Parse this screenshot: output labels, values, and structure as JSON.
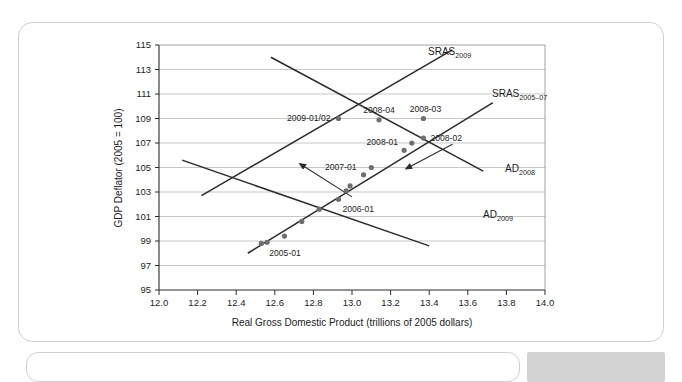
{
  "figure": {
    "background_color": "#ffffff",
    "border_color": "#cfcfcf"
  },
  "chart_data": {
    "type": "scatter",
    "title": "",
    "subtitle": "",
    "xlabel": "Real Gross Domestic Product (trillions of 2005 dollars)",
    "ylabel": "GDP Deflator (2005 = 100)",
    "xlim": [
      12.0,
      14.0
    ],
    "ylim": [
      95,
      115
    ],
    "xticks": [
      "12.0",
      "12.2",
      "12.4",
      "12.6",
      "12.8",
      "13.0",
      "13.2",
      "13.4",
      "13.6",
      "13.8",
      "14.0"
    ],
    "yticks": [
      "95",
      "97",
      "99",
      "101",
      "103",
      "105",
      "107",
      "109",
      "111",
      "113",
      "115"
    ],
    "grid": "horizontal",
    "legend": "none",
    "point_color": "#6e6e6e",
    "line_color": "#2b2b2b",
    "grid_color": "#b9b9b9",
    "points": [
      {
        "label": "2005-01",
        "x": 12.53,
        "y": 98.8
      },
      {
        "label": "",
        "x": 12.56,
        "y": 98.9
      },
      {
        "label": "",
        "x": 12.65,
        "y": 99.4
      },
      {
        "label": "",
        "x": 12.74,
        "y": 100.6
      },
      {
        "label": "",
        "x": 12.83,
        "y": 101.6
      },
      {
        "label": "2006-01",
        "x": 12.93,
        "y": 102.4
      },
      {
        "label": "",
        "x": 12.97,
        "y": 103.1
      },
      {
        "label": "",
        "x": 12.99,
        "y": 103.5
      },
      {
        "label": "2007-01",
        "x": 13.06,
        "y": 104.4
      },
      {
        "label": "",
        "x": 13.1,
        "y": 105.0
      },
      {
        "label": "2008-04",
        "x": 13.14,
        "y": 108.9
      },
      {
        "label": "2008-01",
        "x": 13.27,
        "y": 106.4
      },
      {
        "label": "",
        "x": 13.31,
        "y": 107.0
      },
      {
        "label": "2008-02",
        "x": 13.37,
        "y": 107.4
      },
      {
        "label": "2008-03",
        "x": 13.37,
        "y": 109.0
      },
      {
        "label": "2009-01/02",
        "x": 12.93,
        "y": 109.0
      }
    ],
    "curves": [
      {
        "name": "SRAS_2009",
        "label": "SRAS",
        "sublabel": "2009",
        "slope": "positive",
        "x1": 12.22,
        "y1": 102.7,
        "x2": 13.52,
        "y2": 114.6
      },
      {
        "name": "SRAS_2005-07",
        "label": "SRAS",
        "sublabel": "2005–07",
        "slope": "positive",
        "x1": 12.46,
        "y1": 98.0,
        "x2": 13.73,
        "y2": 110.3
      },
      {
        "name": "AD_2008",
        "label": "AD",
        "sublabel": "2008",
        "slope": "negative",
        "x1": 12.58,
        "y1": 114.0,
        "x2": 13.68,
        "y2": 104.7
      },
      {
        "name": "AD_2009",
        "label": "AD",
        "sublabel": "2009",
        "slope": "negative",
        "x1": 12.12,
        "y1": 105.6,
        "x2": 13.4,
        "y2": 98.6
      }
    ],
    "annotations": [
      {
        "name": "sras-shift-arrow",
        "direction": "up-left",
        "x1": 13.0,
        "y1": 102.6,
        "x2": 12.73,
        "y2": 105.3
      },
      {
        "name": "ad-shift-arrow",
        "direction": "down-left",
        "x1": 13.52,
        "y1": 106.9,
        "x2": 13.28,
        "y2": 104.9
      }
    ]
  }
}
